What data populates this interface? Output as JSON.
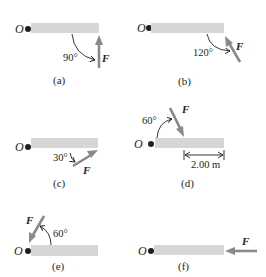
{
  "colors": {
    "bar": "#d6d6d6",
    "arrow": "#8a8a8a",
    "ink": "#231f20"
  },
  "panels": [
    {
      "id": "a",
      "caption": "(a)",
      "origin_label": "O",
      "force_label": "F",
      "angle_label": "90°"
    },
    {
      "id": "b",
      "caption": "(b)",
      "origin_label": "O",
      "force_label": "F",
      "angle_label": "120°"
    },
    {
      "id": "c",
      "caption": "(c)",
      "origin_label": "O",
      "force_label": "F",
      "angle_label": "30°"
    },
    {
      "id": "d",
      "caption": "(d)",
      "origin_label": "O",
      "force_label": "F",
      "angle_label": "60°",
      "dimension_label": "2.00 m"
    },
    {
      "id": "e",
      "caption": "(e)",
      "origin_label": "O",
      "force_label": "F",
      "angle_label": "60°"
    },
    {
      "id": "f",
      "caption": "(f)",
      "origin_label": "O",
      "force_label": "F"
    }
  ]
}
